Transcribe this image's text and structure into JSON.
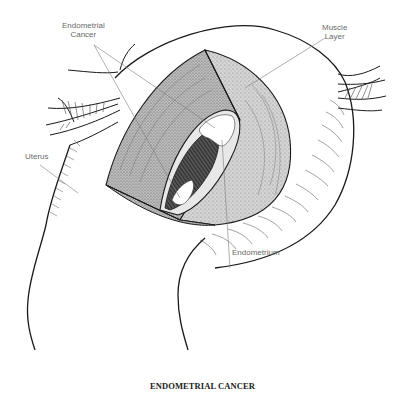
{
  "figure": {
    "title": "ENDOMETRIAL CANCER",
    "type": "anatomical illustration (cut-away view of uterus)",
    "labels": [
      {
        "id": "endometrial-cancer",
        "line1": "Endometrial",
        "line2": "Cancer"
      },
      {
        "id": "muscle-layer",
        "line1": "Muscle",
        "line2": "Layer"
      },
      {
        "id": "uterus",
        "line1": "Uterus"
      },
      {
        "id": "endometrium",
        "line1": "Endometrium"
      }
    ],
    "colors": {
      "outline": "#1a1a1a",
      "muscle_fill": "#c9c9c9",
      "muscle_fill_light": "#dedede",
      "cavity_dark": "#3a3a3a",
      "tumor_fill": "#ffffff",
      "leader_line": "#7a7a7a",
      "label_text": "#6a6a6a"
    }
  }
}
